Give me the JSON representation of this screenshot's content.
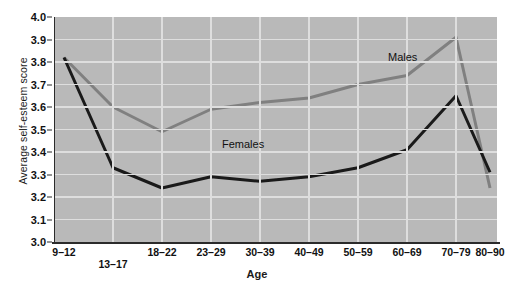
{
  "chart_data": {
    "type": "line",
    "title": "",
    "xlabel": "Age",
    "ylabel": "Average self-esteem score",
    "categories": [
      "9–12",
      "13–17",
      "18–22",
      "23–29",
      "30–39",
      "40–49",
      "50–59",
      "60–69",
      "70–79",
      "80–90"
    ],
    "ylim": [
      3.0,
      4.0
    ],
    "yticks": [
      "3.0",
      "3.1",
      "3.2",
      "3.3",
      "3.4",
      "3.5",
      "3.6",
      "3.7",
      "3.8",
      "3.9",
      "4.0"
    ],
    "grid": true,
    "legend_position": "inline-annotations",
    "series": [
      {
        "name": "Males",
        "color": "#808080",
        "values": [
          3.82,
          3.6,
          3.49,
          3.59,
          3.62,
          3.64,
          3.7,
          3.74,
          3.91,
          3.24
        ],
        "annotation": "Males"
      },
      {
        "name": "Females",
        "color": "#1a1a1a",
        "values": [
          3.82,
          3.33,
          3.24,
          3.29,
          3.27,
          3.29,
          3.33,
          3.41,
          3.65,
          3.31
        ],
        "annotation": "Females"
      }
    ],
    "panel_background": "#b9b9b9",
    "grid_color": "#dedede",
    "axis_color": "#2b2b2b"
  },
  "annotations": {
    "males_label": "Males",
    "females_label": "Females"
  }
}
